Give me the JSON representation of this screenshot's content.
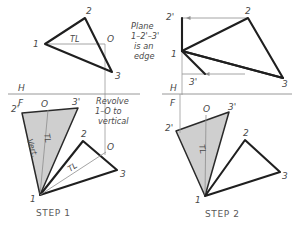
{
  "figure": {
    "colors": {
      "heavy_line": "#1f1f1f",
      "thin_line": "#8d8d8d",
      "shaded_fill": "#cfcfcf",
      "text": "#4a4a4a",
      "background": "#ffffff"
    }
  },
  "panels": {
    "top_left": {
      "name": "top-view-original",
      "points": {
        "p1": "1",
        "p2": "2",
        "p3": "3",
        "p0": "O"
      },
      "tl_label": "TL"
    },
    "top_right": {
      "name": "top-view-revolved",
      "points": {
        "p2prime": "2'",
        "p1": "1",
        "p3prime": "3'",
        "p2": "2",
        "p3": "3"
      },
      "note_lines": [
        "Plane",
        "1–2'–3'",
        "is an",
        "edge"
      ]
    },
    "step1": {
      "label": "STEP  1",
      "points": {
        "p2prime": "2'",
        "p0": "O",
        "p3prime": "3'",
        "p1": "1",
        "p2": "2",
        "p3": "3",
        "p0b": "O"
      },
      "vert_label": "Vert.",
      "tl_label_shaded": "TL",
      "tl_label_open": "TL",
      "note_lines": [
        "Revolve",
        "1–O to",
        "vertical"
      ]
    },
    "step2": {
      "label": "STEP  2",
      "points": {
        "p2prime": "2'",
        "p0": "O",
        "p3prime": "3'",
        "p1": "1",
        "p2": "2",
        "p3": "3"
      },
      "tl_label_shaded": "TL"
    }
  },
  "reference_lines": {
    "left": {
      "h": "H",
      "f": "F"
    },
    "right": {
      "h": "H",
      "f": "F"
    }
  }
}
